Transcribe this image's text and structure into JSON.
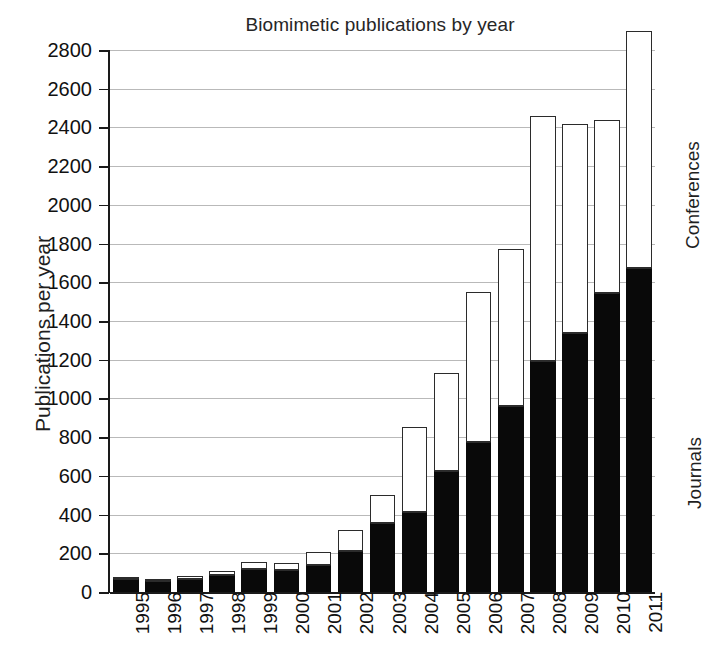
{
  "chart_data": {
    "type": "bar",
    "subtype": "stacked-vertical",
    "title": "Biomimetic publications by year",
    "xlabel": "",
    "ylabel": "Publications per year",
    "ylim": [
      0,
      2800
    ],
    "ytick_step": 200,
    "ytick_labels": [
      "2800",
      "2600",
      "2400",
      "2200",
      "2000",
      "1800",
      "1600",
      "1400",
      "1200",
      "1000",
      "800",
      "600",
      "400",
      "200",
      "0"
    ],
    "ytick_values": [
      2800,
      2600,
      2400,
      2200,
      2000,
      1800,
      1600,
      1400,
      1200,
      1000,
      800,
      600,
      400,
      200,
      0
    ],
    "grid": true,
    "grid_axis": "y",
    "legend_position": "right-outside",
    "categories": [
      "1995",
      "1996",
      "1997",
      "1998",
      "1999",
      "2000",
      "2001",
      "2002",
      "2003",
      "2004",
      "2005",
      "2006",
      "2007",
      "2008",
      "2009",
      "2010",
      "2011"
    ],
    "series": [
      {
        "name": "Journals",
        "color": "#090909",
        "values": [
          65,
          55,
          65,
          90,
          120,
          115,
          140,
          210,
          355,
          415,
          625,
          775,
          960,
          1195,
          1340,
          1545,
          1675
        ]
      },
      {
        "name": "Conferences",
        "color": "#ffffff",
        "values": [
          15,
          10,
          20,
          20,
          35,
          35,
          65,
          110,
          145,
          435,
          505,
          775,
          810,
          1265,
          1080,
          895,
          1225
        ]
      }
    ],
    "totals": [
      80,
      65,
      85,
      110,
      155,
      150,
      205,
      320,
      500,
      850,
      1130,
      1550,
      1770,
      2460,
      2420,
      2440,
      2900
    ],
    "annotations": []
  },
  "legend": {
    "conferences": "Conferences",
    "journals": "Journals"
  },
  "colors": {
    "axis": "#1a1a1a",
    "grid": "#b9b9b9",
    "journals_fill": "#090909",
    "conferences_fill": "#ffffff",
    "bar_stroke": "#2b2b2b",
    "background": "#ffffff"
  }
}
